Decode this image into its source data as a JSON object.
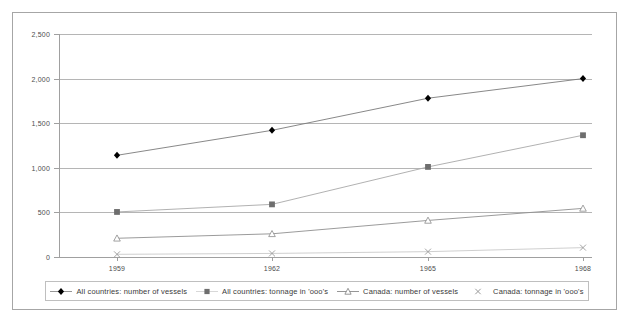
{
  "chart_data": {
    "type": "line",
    "title": "",
    "subtitle": "",
    "xlabel": "",
    "ylabel": "",
    "x": [
      1959,
      1962,
      1965,
      1968
    ],
    "categories": [
      "1959",
      "1962",
      "1965",
      "1968"
    ],
    "xtick_labels": [
      "1959",
      "1962",
      "1965",
      "1968"
    ],
    "ytick_labels": [
      "0",
      "500",
      "1,000",
      "1,500",
      "2,000",
      "2,500"
    ],
    "ytick_values": [
      0,
      500,
      1000,
      1500,
      2000,
      2500
    ],
    "ylim": [
      0,
      2500
    ],
    "grid": "horizontal",
    "legend_position": "bottom",
    "series": [
      {
        "name": "All countries: number of vessels",
        "marker": "filled-diamond",
        "color": "#000000",
        "line_color": "#7a7a7a",
        "values": [
          1140,
          1420,
          1780,
          2000
        ]
      },
      {
        "name": "All countries: tonnage in 'ooo's",
        "marker": "filled-square",
        "color": "#6e6e6e",
        "line_color": "#a8a8a8",
        "values": [
          505,
          590,
          1010,
          1365
        ]
      },
      {
        "name": "Canada: number of vessels",
        "marker": "open-triangle",
        "color": "#8a8a8a",
        "line_color": "#909090",
        "values": [
          210,
          260,
          410,
          545
        ]
      },
      {
        "name": "Canada: tonnage in 'ooo's",
        "marker": "cross-x",
        "color": "#9a9a9a",
        "line_color": "#c9c9c9",
        "values": [
          30,
          40,
          60,
          105
        ]
      }
    ]
  },
  "legend": {
    "items": [
      {
        "label": "All countries: number of vessels",
        "key": "filled-diamond-with-line"
      },
      {
        "label": "All countries: tonnage in 'ooo's",
        "key": "filled-square-marker"
      },
      {
        "label": "Canada: number of vessels",
        "key": "open-triangle-with-line"
      },
      {
        "label": "Canada: tonnage in 'ooo's",
        "key": "cross-x-marker"
      }
    ]
  }
}
